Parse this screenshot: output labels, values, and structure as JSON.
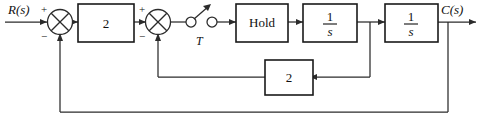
{
  "diagram": {
    "type": "control-block-diagram",
    "signals": {
      "input": "R(s)",
      "output": "C(s)",
      "sample_period": "T"
    },
    "blocks": [
      {
        "id": "gain-forward",
        "label": "2",
        "kind": "gain"
      },
      {
        "id": "hold",
        "label": "Hold",
        "kind": "hold"
      },
      {
        "id": "integrator-1",
        "numerator": "1",
        "denominator": "s",
        "kind": "integrator"
      },
      {
        "id": "integrator-2",
        "numerator": "1",
        "denominator": "s",
        "kind": "integrator"
      },
      {
        "id": "gain-feedback-inner",
        "label": "2",
        "kind": "gain"
      }
    ],
    "summing_junctions": [
      {
        "id": "sum-1",
        "plus": "+",
        "minus": "−"
      },
      {
        "id": "sum-2",
        "plus": "+",
        "minus": "−"
      }
    ],
    "sampler": {
      "id": "sampler-switch",
      "label": "T"
    },
    "colors": {
      "line": "#2b2b2b",
      "block_border": "#1a1a1a",
      "background": "#ffffff",
      "text": "#111111"
    }
  }
}
